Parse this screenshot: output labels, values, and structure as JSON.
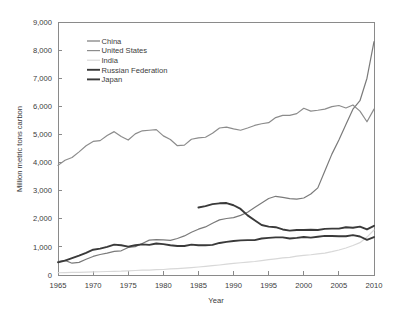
{
  "chart_data": {
    "type": "line",
    "title": "",
    "xlabel": "Year",
    "ylabel": "Million metric tons carbon",
    "xlim": [
      1965,
      2010
    ],
    "ylim": [
      0,
      9000
    ],
    "xticks": [
      1965,
      1970,
      1975,
      1980,
      1985,
      1990,
      1995,
      2000,
      2005,
      2010
    ],
    "xtick_labels": [
      "1965",
      "1970",
      "1975",
      "1980",
      "1985",
      "1990",
      "1995",
      "2000",
      "2005",
      "2010"
    ],
    "yticks": [
      0,
      1000,
      2000,
      3000,
      4000,
      5000,
      6000,
      7000,
      8000,
      9000
    ],
    "ytick_labels": [
      "0",
      "1,000",
      "2,000",
      "3,000",
      "4,000",
      "5,000",
      "6,000",
      "7,000",
      "8,000",
      "9,000"
    ],
    "grid": false,
    "legend_position": "top-left",
    "series": [
      {
        "name": "China",
        "color": "#7a7a7a",
        "width": 1.2,
        "x": [
          1965,
          1966,
          1967,
          1968,
          1969,
          1970,
          1971,
          1972,
          1973,
          1974,
          1975,
          1976,
          1977,
          1978,
          1979,
          1980,
          1981,
          1982,
          1983,
          1984,
          1985,
          1986,
          1987,
          1988,
          1989,
          1990,
          1991,
          1992,
          1993,
          1994,
          1995,
          1996,
          1997,
          1998,
          1999,
          2000,
          2001,
          2002,
          2003,
          2004,
          2005,
          2006,
          2007,
          2008,
          2009,
          2010
        ],
        "values": [
          480,
          520,
          420,
          450,
          560,
          660,
          730,
          780,
          840,
          860,
          980,
          1010,
          1120,
          1240,
          1260,
          1250,
          1230,
          1300,
          1390,
          1520,
          1630,
          1710,
          1840,
          1960,
          2010,
          2040,
          2120,
          2230,
          2400,
          2560,
          2720,
          2800,
          2760,
          2720,
          2700,
          2740,
          2880,
          3100,
          3700,
          4300,
          4800,
          5350,
          5900,
          6200,
          7000,
          8300
        ]
      },
      {
        "name": "United States",
        "color": "#8c8c8c",
        "width": 1.2,
        "x": [
          1965,
          1966,
          1967,
          1968,
          1969,
          1970,
          1971,
          1972,
          1973,
          1974,
          1975,
          1976,
          1977,
          1978,
          1979,
          1980,
          1981,
          1982,
          1983,
          1984,
          1985,
          1986,
          1987,
          1988,
          1989,
          1990,
          1991,
          1992,
          1993,
          1994,
          1995,
          1996,
          1997,
          1998,
          1999,
          2000,
          2001,
          2002,
          2003,
          2004,
          2005,
          2006,
          2007,
          2008,
          2009,
          2010
        ],
        "values": [
          3900,
          4080,
          4180,
          4380,
          4600,
          4750,
          4780,
          4960,
          5100,
          4930,
          4800,
          5020,
          5130,
          5150,
          5170,
          4950,
          4820,
          4600,
          4620,
          4830,
          4880,
          4900,
          5040,
          5230,
          5260,
          5200,
          5150,
          5230,
          5320,
          5380,
          5420,
          5600,
          5680,
          5680,
          5740,
          5930,
          5830,
          5860,
          5900,
          5990,
          6030,
          5940,
          6050,
          5830,
          5450,
          5900
        ]
      },
      {
        "name": "India",
        "color": "#d8d8d8",
        "width": 1.2,
        "x": [
          1965,
          1966,
          1967,
          1968,
          1969,
          1970,
          1971,
          1972,
          1973,
          1974,
          1975,
          1976,
          1977,
          1978,
          1979,
          1980,
          1981,
          1982,
          1983,
          1984,
          1985,
          1986,
          1987,
          1988,
          1989,
          1990,
          1991,
          1992,
          1993,
          1994,
          1995,
          1996,
          1997,
          1998,
          1999,
          2000,
          2001,
          2002,
          2003,
          2004,
          2005,
          2006,
          2007,
          2008,
          2009,
          2010
        ],
        "values": [
          80,
          85,
          90,
          95,
          105,
          110,
          115,
          125,
          130,
          135,
          150,
          160,
          170,
          175,
          190,
          195,
          215,
          230,
          245,
          265,
          285,
          305,
          330,
          355,
          385,
          410,
          435,
          460,
          480,
          510,
          545,
          575,
          610,
          630,
          670,
          700,
          720,
          750,
          780,
          830,
          890,
          960,
          1050,
          1150,
          1350,
          1600
        ]
      },
      {
        "name": "Russian Federation",
        "color": "#3a3a3a",
        "width": 1.9,
        "x": [
          1985,
          1986,
          1987,
          1988,
          1989,
          1990,
          1991,
          1992,
          1993,
          1994,
          1995,
          1996,
          1997,
          1998,
          1999,
          2000,
          2001,
          2002,
          2003,
          2004,
          2005,
          2006,
          2007,
          2008,
          2009,
          2010
        ],
        "values": [
          2400,
          2450,
          2520,
          2550,
          2560,
          2480,
          2350,
          2120,
          1950,
          1780,
          1720,
          1700,
          1620,
          1580,
          1600,
          1600,
          1610,
          1600,
          1640,
          1650,
          1650,
          1700,
          1680,
          1720,
          1620,
          1750
        ]
      },
      {
        "name": "Japan",
        "color": "#3a3a3a",
        "width": 1.9,
        "x": [
          1965,
          1966,
          1967,
          1968,
          1969,
          1970,
          1971,
          1972,
          1973,
          1974,
          1975,
          1976,
          1977,
          1978,
          1979,
          1980,
          1981,
          1982,
          1983,
          1984,
          1985,
          1986,
          1987,
          1988,
          1989,
          1990,
          1991,
          1992,
          1993,
          1994,
          1995,
          1996,
          1997,
          1998,
          1999,
          2000,
          2001,
          2002,
          2003,
          2004,
          2005,
          2006,
          2007,
          2008,
          2009,
          2010
        ],
        "values": [
          450,
          510,
          600,
          690,
          790,
          900,
          940,
          1000,
          1080,
          1060,
          1010,
          1060,
          1090,
          1070,
          1120,
          1100,
          1060,
          1030,
          1030,
          1080,
          1060,
          1060,
          1070,
          1140,
          1180,
          1210,
          1230,
          1240,
          1240,
          1300,
          1320,
          1340,
          1340,
          1300,
          1320,
          1350,
          1330,
          1360,
          1390,
          1390,
          1380,
          1380,
          1420,
          1370,
          1250,
          1350
        ]
      }
    ],
    "legend_entries": [
      {
        "label": "China",
        "color": "#7a7a7a",
        "width": 1.2
      },
      {
        "label": "United States",
        "color": "#8c8c8c",
        "width": 1.2
      },
      {
        "label": "India",
        "color": "#d8d8d8",
        "width": 1.2
      },
      {
        "label": "Russian Federation",
        "color": "#3a3a3a",
        "width": 1.9
      },
      {
        "label": "Japan",
        "color": "#3a3a3a",
        "width": 1.9
      }
    ]
  }
}
